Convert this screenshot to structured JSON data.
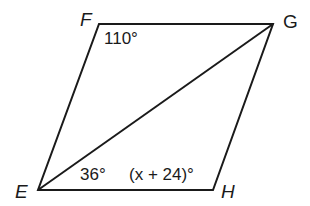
{
  "diagram": {
    "type": "parallelogram-with-diagonal",
    "vertices": {
      "F": {
        "label": "F",
        "x": 99,
        "y": 24
      },
      "G": {
        "label": "G",
        "x": 273,
        "y": 24
      },
      "H": {
        "label": "H",
        "x": 213,
        "y": 190
      },
      "E": {
        "label": "E",
        "x": 38,
        "y": 190
      }
    },
    "segments": [
      "EF",
      "FG",
      "GH",
      "HE",
      "EG"
    ],
    "angles": {
      "F": "110°",
      "E_lower": "36°",
      "H": "(x + 24)°"
    },
    "line_color": "#1a1a1a"
  }
}
